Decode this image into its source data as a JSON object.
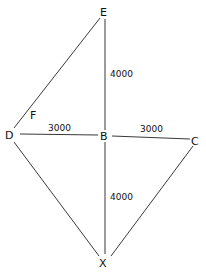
{
  "diagram": {
    "type": "geometry",
    "points": [
      {
        "id": "E",
        "label": "E"
      },
      {
        "id": "D",
        "label": "D"
      },
      {
        "id": "B",
        "label": "B"
      },
      {
        "id": "C",
        "label": "C"
      },
      {
        "id": "X",
        "label": "X"
      },
      {
        "id": "F",
        "label": "F"
      }
    ],
    "edges": [
      {
        "from": "D",
        "to": "E",
        "label": ""
      },
      {
        "from": "E",
        "to": "B",
        "label": "4000"
      },
      {
        "from": "D",
        "to": "B",
        "label": "3000"
      },
      {
        "from": "B",
        "to": "C",
        "label": "3000"
      },
      {
        "from": "B",
        "to": "X",
        "label": "4000"
      },
      {
        "from": "D",
        "to": "X",
        "label": ""
      },
      {
        "from": "C",
        "to": "X",
        "label": ""
      }
    ],
    "labels": {
      "E": "E",
      "D": "D",
      "B": "B",
      "C": "C",
      "X": "X",
      "F": "F",
      "EB": "4000",
      "DB": "3000",
      "BC": "3000",
      "BX": "4000"
    }
  }
}
